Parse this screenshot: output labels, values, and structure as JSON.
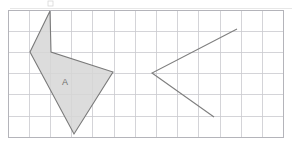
{
  "canvas": {
    "width": 301,
    "height": 145,
    "background": "#ffffff"
  },
  "grid": {
    "origin_x": 8,
    "origin_y": 10,
    "cell": 21.2,
    "cols": 13,
    "rows": 6,
    "line_color": "#c9c9ce",
    "border_color": "#b4b4ba"
  },
  "chart_data": {
    "type": "diagram",
    "title": "",
    "shapes": [
      {
        "name": "shape-a",
        "label": "A",
        "label_x": 65,
        "label_y": 83,
        "filled": true,
        "fill_color": "#d6d6d6",
        "stroke_color": "#7a7a7a",
        "closed": true,
        "points": "50,11 30,52 74,134 113,72 51,52",
        "vertices": [
          [
            50,
            11
          ],
          [
            30,
            52
          ],
          [
            74,
            134
          ],
          [
            113,
            72
          ],
          [
            51,
            52
          ]
        ]
      },
      {
        "name": "shape-chevron",
        "label": "",
        "filled": false,
        "fill_color": "none",
        "stroke_color": "#7f7f7f",
        "closed": false,
        "points": "237,29 152,73 214,117",
        "vertices": [
          [
            237,
            29
          ],
          [
            152,
            73
          ],
          [
            214,
            117
          ]
        ]
      }
    ],
    "grid": {
      "on": true,
      "cols": 13,
      "rows": 6,
      "cell_size": 21.2
    }
  },
  "artifacts": {
    "top_rule_y": 8,
    "top_rule_x1": 10,
    "top_rule_x2": 292,
    "mark_x": 48,
    "mark_y": 1,
    "mark_w": 5,
    "mark_h": 5
  }
}
